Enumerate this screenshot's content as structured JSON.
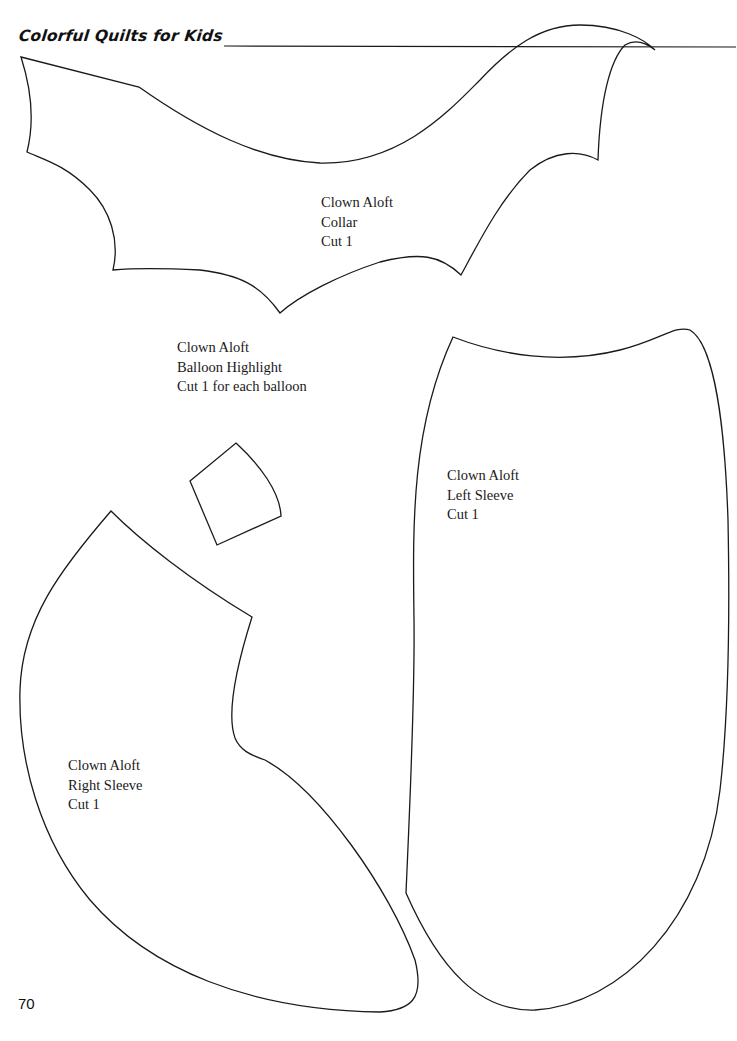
{
  "header": {
    "title": "Colorful Quilts for Kids"
  },
  "patterns": [
    {
      "id": "collar",
      "lines": [
        "Clown Aloft",
        "Collar",
        "Cut 1"
      ]
    },
    {
      "id": "balloon-highlight",
      "lines": [
        "Clown Aloft",
        "Balloon Highlight",
        "Cut 1 for each balloon"
      ]
    },
    {
      "id": "left-sleeve",
      "lines": [
        "Clown Aloft",
        "Left Sleeve",
        "Cut 1"
      ]
    },
    {
      "id": "right-sleeve",
      "lines": [
        "Clown Aloft",
        "Right Sleeve",
        "Cut 1"
      ]
    }
  ],
  "footer": {
    "page_number": "70"
  },
  "colors": {
    "stroke": "#1a1a1a",
    "background": "#ffffff"
  }
}
